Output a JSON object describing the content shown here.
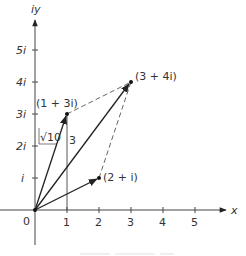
{
  "diagram": {
    "axes": {
      "x_label": "x",
      "y_label": "iy",
      "origin_label": "0",
      "x_ticks": [
        "1",
        "2",
        "3",
        "4",
        "5"
      ],
      "y_ticks": [
        "i",
        "2i",
        "3i",
        "4i",
        "5i"
      ]
    },
    "points": [
      {
        "label": "(1 + 3i)",
        "re": 1,
        "im": 3
      },
      {
        "label": "(2 + i)",
        "re": 2,
        "im": 1
      },
      {
        "label": "(3 + 4i)",
        "re": 3,
        "im": 4
      }
    ],
    "annotations": {
      "magnitude": "√10",
      "height": "3"
    },
    "colors": {
      "line": "#333333",
      "dashed": "#555555"
    }
  }
}
